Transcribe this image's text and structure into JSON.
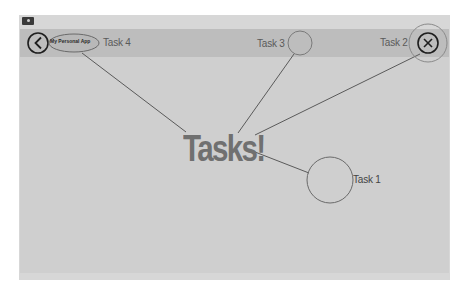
{
  "window": {
    "icon": "app-window-icon"
  },
  "header": {
    "back_icon": "chevron-left-circle-icon",
    "app_name": "My Personal App",
    "close_icon": "close-circle-icon"
  },
  "tasks": [
    {
      "id": "task-4",
      "label": "Task 4"
    },
    {
      "id": "task-3",
      "label": "Task 3"
    },
    {
      "id": "task-2",
      "label": "Task 2"
    },
    {
      "id": "task-1",
      "label": "Task 1"
    }
  ],
  "main": {
    "title": "Tasks!"
  },
  "colors": {
    "frame": "#d7d7d7",
    "topbar": "#bdbdbd",
    "content": "#cfcfcf",
    "line": "#555555",
    "title_text": "#707070"
  }
}
